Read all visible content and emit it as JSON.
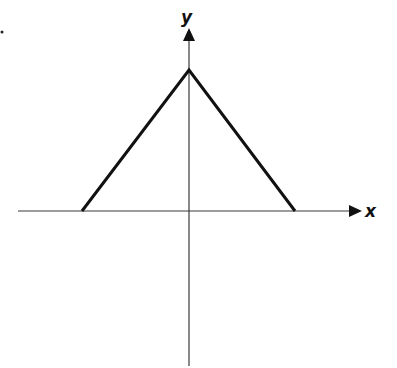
{
  "figure": {
    "x_axis_label": "x",
    "y_axis_label": "y",
    "origin_px": [
      189,
      211
    ],
    "curve_points_px": [
      [
        82,
        211
      ],
      [
        189,
        70
      ],
      [
        295,
        211
      ]
    ],
    "colors": {
      "axis": "#3a3a3a",
      "curve": "#111111",
      "background": "#ffffff"
    }
  }
}
